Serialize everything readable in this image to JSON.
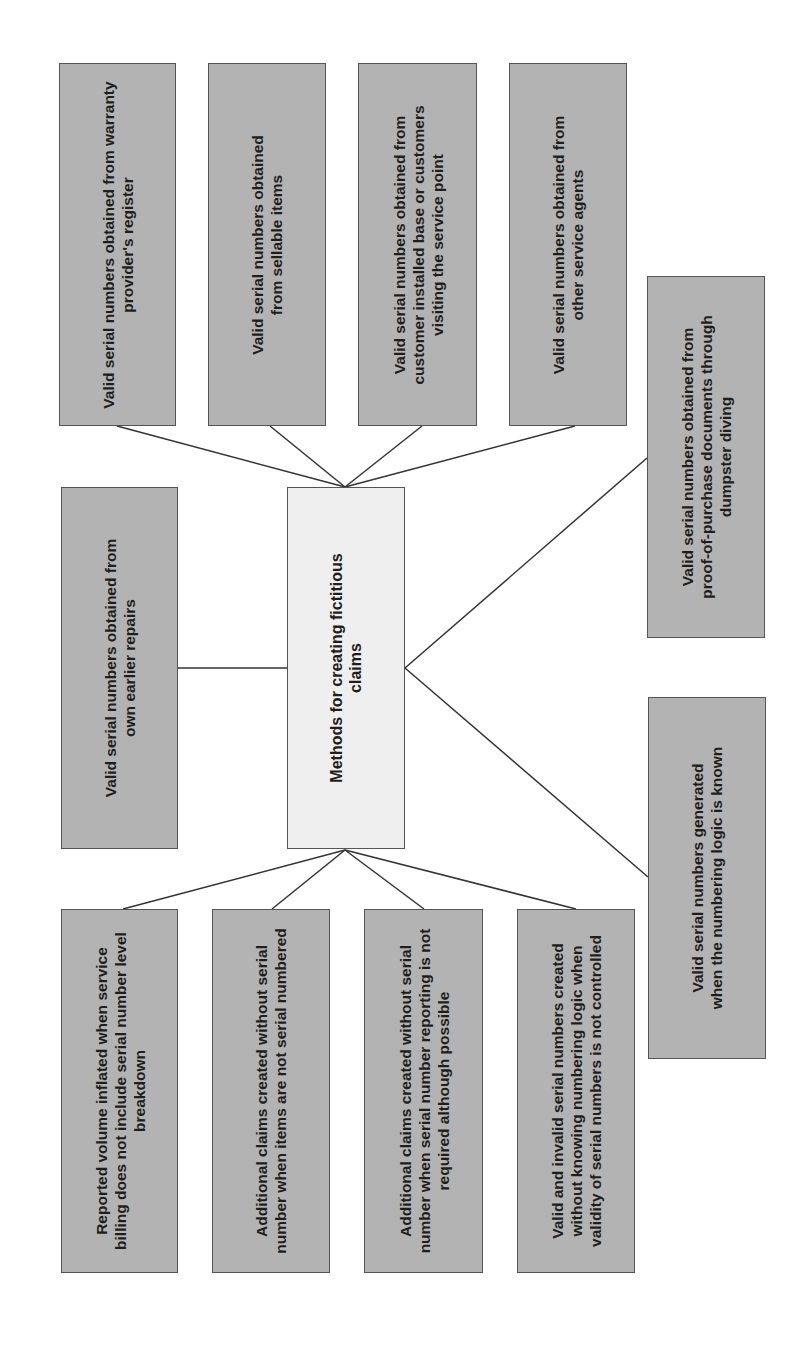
{
  "diagram": {
    "center": {
      "label": "Methods for creating fictitious claims"
    },
    "top_row": [
      {
        "label": "Valid serial numbers obtained from warranty provider's register"
      },
      {
        "label": "Valid serial numbers obtained from sellable items"
      },
      {
        "label": "Valid serial numbers obtained from customer installed base or customers visiting the service point"
      },
      {
        "label": "Valid serial numbers obtained from other service agents"
      }
    ],
    "left_middle": {
      "label": "Valid serial numbers obtained from own earlier repairs"
    },
    "right_upper": {
      "label": "Valid serial numbers obtained from proof-of-purchase documents through dumpster diving"
    },
    "right_lower": {
      "label": "Valid serial numbers generated when the numbering logic is known"
    },
    "bottom_row": [
      {
        "label": "Reported volume inflated when service billing does not include serial number level breakdown"
      },
      {
        "label": "Additional claims created without serial number when items are not serial numbered"
      },
      {
        "label": "Additional claims created without serial number when serial number reporting is not required although possible"
      },
      {
        "label": "Valid and invalid serial numbers created without knowing numbering logic when validity of serial numbers is not controlled"
      }
    ],
    "colors": {
      "box_fill": "#b3b3b3",
      "center_fill": "#efefef",
      "border": "#555555",
      "line": "#333333"
    },
    "orientation": "rotated -90deg"
  }
}
